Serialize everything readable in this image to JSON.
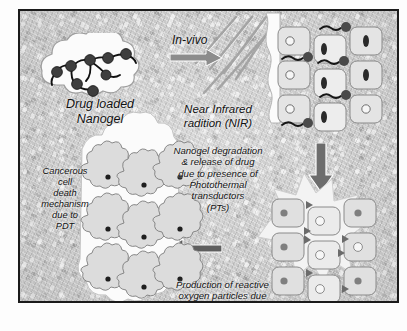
{
  "figure": {
    "background_color": "#c9c9c9",
    "frame_color": "#1b1b1b"
  },
  "labels": {
    "nanogel": "Drug loaded\nNanogel",
    "invivo": "In-vivo",
    "nir": "Near Infrared\nradition (NIR)",
    "degradation": "Nanogel degradation\n& release of drug\ndue to presence of\nPhotothermal\ntransductors\n(PTs)",
    "pdt": "Cancerous\ncell\ndeath\nmechanism\ndue to\nPDT",
    "ros": "Production of reactive\noxygen particles due\nNIR absorption by PTs"
  },
  "stages": [
    {
      "id": "drug-loaded-nanogel",
      "label": "Drug loaded Nanogel",
      "description": "White cloud-shaped nanogel containing dark drug spheres linked by polymer chains",
      "particle_count": 8
    },
    {
      "id": "nir-irradiation",
      "label": "Near Infrared radition (NIR)",
      "description": "Diagonal NIR beam lines striking healthy tumour cells with internalised nanogels",
      "beam_count": 6
    },
    {
      "id": "nanogel-degradation",
      "label": "Nanogel degradation & release of drug due to presence of Photothermal transductors (PTs)",
      "description": "Cell grid with nanogel particles entering cells"
    },
    {
      "id": "ros-production",
      "label": "Production of reactive oxygen particles due NIR absorption by PTs",
      "description": "Starburst burst behind cell grid generating reactive oxygen species"
    },
    {
      "id": "cell-death",
      "label": "Cancerous cell death mechanism due to PDT",
      "description": "Three by three grid of shrunken apoptotic cancer cells",
      "cell_rows": 3,
      "cell_cols": 3
    }
  ],
  "arrows": [
    {
      "id": "arrow-invivo",
      "direction": "right",
      "label": "In-vivo",
      "color": "#8c8c8c"
    },
    {
      "id": "arrow-down",
      "direction": "down",
      "label": "",
      "color": "#6d6d6d"
    },
    {
      "id": "arrow-left",
      "direction": "left",
      "label": "",
      "color": "#5e5e5e"
    }
  ],
  "colors": {
    "background": "#c9c9c9",
    "frame": "#1b1b1b",
    "text": "#111111",
    "cell_fill": "#e2e2e2",
    "cell_stroke": "#8a8a8a",
    "nucleus": "#f4f4f4",
    "nanogel_particle": "#4a4a4a",
    "cloud": "#fbfbfb",
    "beam": "#9a9a9a",
    "burst": "#f2f2f2"
  }
}
